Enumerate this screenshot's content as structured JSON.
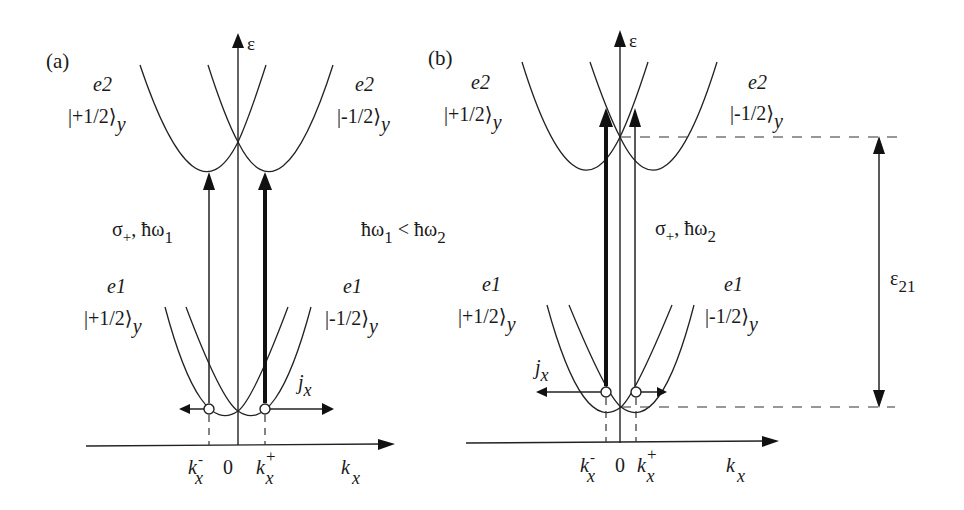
{
  "figure": {
    "panels": [
      {
        "id": "a",
        "panel_label": "(a)",
        "y_axis_label": "ε",
        "x_axis_label_main": "k",
        "x_axis_label_sub": "x",
        "origin_label": "0",
        "k_minus_main": "k",
        "k_minus_sub": "x",
        "k_minus_sup": "-",
        "k_plus_main": "k",
        "k_plus_sub": "x",
        "k_plus_sup": "+",
        "e2_left_band": "e2",
        "e2_left_state": "|+1/2⟩",
        "e2_left_sub": "y",
        "e2_right_band": "e2",
        "e2_right_state": "|-1/2⟩",
        "e2_right_sub": "y",
        "e1_left_band": "e1",
        "e1_left_state": "|+1/2⟩",
        "e1_left_sub": "y",
        "e1_right_band": "e1",
        "e1_right_state": "|-1/2⟩",
        "e1_right_sub": "y",
        "excitation_main": "σ",
        "excitation_sub_plus": "+",
        "excitation_sep": ", ħω",
        "excitation_sub": "1",
        "current_main": "j",
        "current_sub": "x",
        "comparison_a": "ħω",
        "comparison_a_sub": "1",
        "comparison_op": " < ħω",
        "comparison_b_sub": "2"
      },
      {
        "id": "b",
        "panel_label": "(b)",
        "y_axis_label": "ε",
        "x_axis_label_main": "k",
        "x_axis_label_sub": "x",
        "origin_label": "0",
        "k_minus_main": "k",
        "k_minus_sub": "x",
        "k_minus_sup": "-",
        "k_plus_main": "k",
        "k_plus_sub": "x",
        "k_plus_sup": "+",
        "e2_left_band": "e2",
        "e2_left_state": "|+1/2⟩",
        "e2_left_sub": "y",
        "e2_right_band": "e2",
        "e2_right_state": "|-1/2⟩",
        "e2_right_sub": "y",
        "e1_left_band": "e1",
        "e1_left_state": "|+1/2⟩",
        "e1_left_sub": "y",
        "e1_right_band": "e1",
        "e1_right_state": "|-1/2⟩",
        "e1_right_sub": "y",
        "excitation_main": "σ",
        "excitation_sub_plus": "+",
        "excitation_sep": ", ħω",
        "excitation_sub": "2",
        "current_main": "j",
        "current_sub": "x",
        "gap_main": "ε",
        "gap_sub": "21"
      }
    ]
  }
}
